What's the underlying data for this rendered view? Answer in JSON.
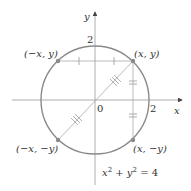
{
  "diagram": {
    "axes": {
      "x_label": "x",
      "y_label": "y",
      "origin_label": "0",
      "x_tick_label": "2",
      "y_tick_label": "2"
    },
    "equation": {
      "lhs_x": "x",
      "exp1": "2",
      "plus": " + ",
      "lhs_y": "y",
      "exp2": "2",
      "rhs": " = 4"
    },
    "points": [
      {
        "label": "(x, y)"
      },
      {
        "label": "(−x, y)"
      },
      {
        "label": "(−x, −y)"
      },
      {
        "label": "(x, −y)"
      }
    ],
    "colors": {
      "circle": "#8a8a8a",
      "point": "#8a8a8a",
      "axis": "#888888",
      "segment": "#aaaaaa"
    }
  }
}
